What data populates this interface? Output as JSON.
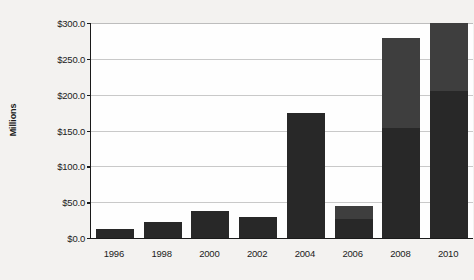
{
  "chart_data": {
    "type": "bar",
    "title": "",
    "subtitle": "",
    "xlabel": "",
    "ylabel": "Millions",
    "stacked": true,
    "grid": true,
    "legend": "none",
    "ylim": [
      0,
      300
    ],
    "ytick_step": 50,
    "ytick_labels": [
      "$0.0",
      "$50.0",
      "$100.0",
      "$150.0",
      "$200.0",
      "$250.0",
      "$300.0"
    ],
    "ytick_values": [
      0,
      50,
      100,
      150,
      200,
      250,
      300
    ],
    "categories": [
      "1996",
      "1998",
      "2000",
      "2002",
      "2004",
      "2006",
      "2008",
      "2010"
    ],
    "series": [
      {
        "name": "lower-segment",
        "color": "#282828",
        "values": [
          13,
          22,
          38,
          29,
          175,
          27,
          153,
          205
        ]
      },
      {
        "name": "upper-segment",
        "color": "#3e3e3e",
        "values": [
          0,
          0,
          0,
          0,
          0,
          18,
          126,
          95
        ]
      }
    ],
    "totals": [
      13,
      22,
      38,
      29,
      175,
      45,
      279,
      300
    ],
    "colors": {
      "plot_background": "#fefefe",
      "page_background": "#f3f2f0",
      "axis": "#1a1a1a",
      "gridline": "#c9c9c9",
      "text": "#1b1b1b"
    }
  }
}
